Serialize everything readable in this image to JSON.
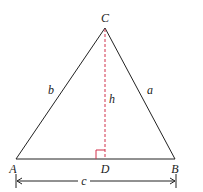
{
  "diagram": {
    "type": "triangle-altitude",
    "vertices": {
      "A": {
        "label": "A"
      },
      "B": {
        "label": "B"
      },
      "C": {
        "label": "C"
      },
      "D": {
        "label": "D"
      }
    },
    "sides": {
      "a": {
        "label": "a"
      },
      "b": {
        "label": "b"
      },
      "c": {
        "label": "c"
      }
    },
    "altitude": {
      "label": "h"
    },
    "colors": {
      "stroke": "#222222",
      "altitude": "#d0304a",
      "right_angle": "#d0304a"
    }
  }
}
